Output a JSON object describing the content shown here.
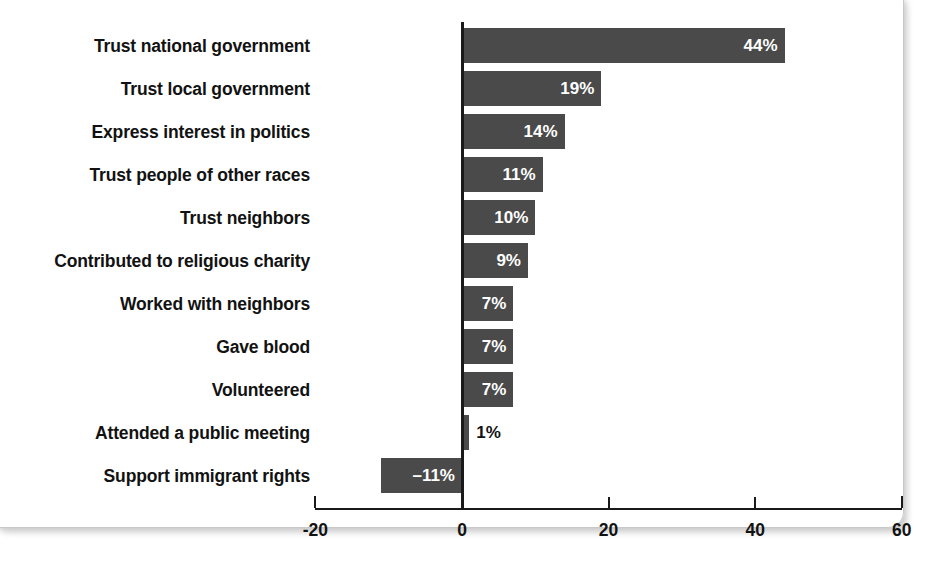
{
  "chart_data": {
    "type": "bar",
    "orientation": "horizontal",
    "title": "",
    "subtitle": "",
    "xlabel": "",
    "ylabel": "",
    "xlim": [
      -20,
      60
    ],
    "grid": false,
    "legend": null,
    "bar_color": "#4a4a4a",
    "value_suffix": "%",
    "xticks": [
      {
        "value": -20,
        "label": "-20"
      },
      {
        "value": 0,
        "label": "0"
      },
      {
        "value": 20,
        "label": "20"
      },
      {
        "value": 40,
        "label": "40"
      },
      {
        "value": 60,
        "label": "60"
      }
    ],
    "categories": [
      "Trust national government",
      "Trust local government",
      "Express interest in politics",
      "Trust people of other races",
      "Trust neighbors",
      "Contributed to religious charity",
      "Worked with neighbors",
      "Gave blood",
      "Volunteered",
      "Attended a public meeting",
      "Support immigrant rights"
    ],
    "values": [
      44,
      19,
      14,
      11,
      10,
      9,
      7,
      7,
      7,
      1,
      -11
    ],
    "value_labels": [
      "44%",
      "19%",
      "14%",
      "11%",
      "10%",
      "9%",
      "7%",
      "7%",
      "7%",
      "1%",
      "–11%"
    ],
    "label_placement": [
      "inside",
      "inside",
      "inside",
      "inside",
      "inside",
      "inside",
      "inside",
      "inside",
      "inside",
      "outside",
      "inside"
    ]
  }
}
